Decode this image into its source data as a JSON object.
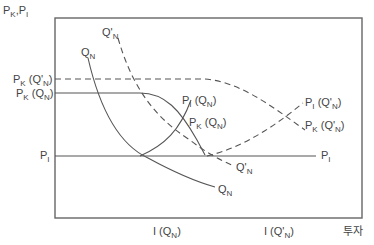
{
  "diagram": {
    "y_axis_label": {
      "main": "P",
      "sub1": "K",
      "sep": ",P",
      "sub2": "I"
    },
    "x_axis_label": "투자",
    "left_labels": {
      "pk_qn_prime": {
        "main": "P",
        "sub": "K",
        "paren": " (Q'",
        "psub": "N",
        "close": ")"
      },
      "pk_qn": {
        "main": "P",
        "sub": "K",
        "paren": " (Q",
        "psub": "N",
        "close": ")"
      },
      "pi": {
        "main": "P",
        "sub": "I"
      }
    },
    "curve_labels": {
      "qn_top": {
        "main": "Q",
        "sub": "N"
      },
      "qn_prime_top": {
        "main": "Q'",
        "sub": "N"
      },
      "pi_qn": {
        "main": "P",
        "sub": "I",
        "paren": " (Q",
        "psub": "N",
        "close": ")"
      },
      "pk_qn": {
        "main": "P",
        "sub": "K",
        "paren": " (Q",
        "psub": "N",
        "close": ")"
      },
      "pi_qn_prime": {
        "main": "P",
        "sub": "I",
        "paren": " (Q'",
        "psub": "N",
        "close": ")"
      },
      "pk_qn_prime": {
        "main": "P",
        "sub": "K",
        "paren": " (Q'",
        "psub": "N",
        "close": ")"
      },
      "qn_prime_bottom": {
        "main": "Q'",
        "sub": "N"
      },
      "qn_bottom": {
        "main": "Q",
        "sub": "N"
      },
      "pi_right": {
        "main": "P",
        "sub": "I"
      }
    },
    "x_ticks": {
      "i_qn": {
        "main": "I (Q",
        "sub": "N",
        "close": ")"
      },
      "i_qn_prime": {
        "main": "I (Q'",
        "sub": "N",
        "close": ")"
      }
    },
    "colors": {
      "line": "#555555",
      "text": "#444444",
      "frame": "#666666"
    }
  }
}
